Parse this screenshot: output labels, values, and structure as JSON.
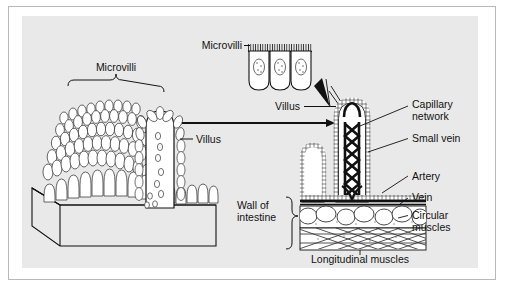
{
  "figure": {
    "background": "#e9e9e9",
    "frame_color": "#b9b9b9",
    "ink": "#111111"
  },
  "labels": {
    "microvilli_bracket": "Microvilli",
    "microvilli_inset": "Microvilli",
    "villus_left": "Villus",
    "villus_right": "Villus",
    "capillary_network_line1": "Capillary",
    "capillary_network_line2": "network",
    "small_vein": "Small vein",
    "artery": "Artery",
    "vein": "Vein",
    "circular_muscles_line1": "Circular",
    "circular_muscles_line2": "muscles",
    "longitudinal_muscles": "Longitudinal muscles",
    "wall_of_intestine_line1": "Wall of",
    "wall_of_intestine_line2": "intestine"
  },
  "panels": {
    "left": {
      "name": "three-dimensional block of intestinal lining",
      "description": "Cut-away perspective block showing villi covered in microvilli"
    },
    "inset": {
      "name": "epithelial cell detail",
      "cell_count": 3,
      "description": "Three columnar epithelial cells with nuclei and microvilli brush border"
    },
    "right": {
      "name": "villus cross-section with intestinal wall layers",
      "villus_count": 2,
      "description": "Sectioned villus showing capillary network, small vein, artery and vein over circular and longitudinal muscle layers"
    }
  },
  "connectors": {
    "magnification_arrow": "villus tip to epithelial cell inset",
    "transfer_arrow": "left block to villus cross-section"
  }
}
